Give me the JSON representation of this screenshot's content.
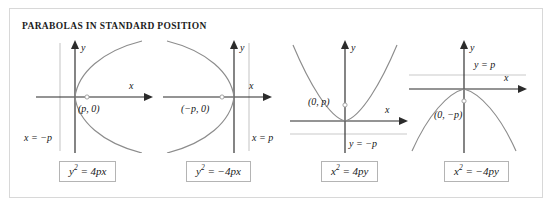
{
  "figure": {
    "title": "PARABOLAS IN STANDARD POSITION"
  },
  "panels": [
    {
      "id": "parabola-right",
      "opens": "right",
      "equation_lhs": "y",
      "equation_exp": "2",
      "equation_rhs": "= 4px",
      "focus_label": "(p, 0)",
      "directrix_label": "x = −p",
      "x_axis_label": "x",
      "y_axis_label": "y"
    },
    {
      "id": "parabola-left",
      "opens": "left",
      "equation_lhs": "y",
      "equation_exp": "2",
      "equation_rhs": "= −4px",
      "focus_label": "(−p, 0)",
      "directrix_label": "x = p",
      "x_axis_label": "x",
      "y_axis_label": "y"
    },
    {
      "id": "parabola-up",
      "opens": "up",
      "equation_lhs": "x",
      "equation_exp": "2",
      "equation_rhs": "= 4py",
      "focus_label": "(0, p)",
      "directrix_label": "y = −p",
      "x_axis_label": "x",
      "y_axis_label": "y"
    },
    {
      "id": "parabola-down",
      "opens": "down",
      "equation_lhs": "x",
      "equation_exp": "2",
      "equation_rhs": "= −4py",
      "focus_label": "(0, −p)",
      "directrix_label": "y = p",
      "x_axis_label": "x",
      "y_axis_label": "y"
    }
  ],
  "colors": {
    "curve": "#8c8c8c",
    "axis": "#2b2b2b",
    "directrix": "#c9c9c9",
    "border": "#d8d8d8",
    "text": "#1c1c1c"
  }
}
